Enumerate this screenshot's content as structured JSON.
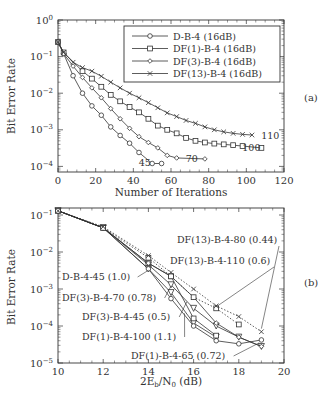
{
  "chart_data": [
    {
      "panel": "(a)",
      "type": "line",
      "title": "",
      "xlabel": "Number of Iterations",
      "ylabel": "Bit Error Rate",
      "xscale": "linear",
      "yscale": "log",
      "xlim": [
        0,
        120
      ],
      "ylim": [
        4e-05,
        1
      ],
      "xticks": [
        "0",
        "20",
        "40",
        "60",
        "80",
        "100",
        "120"
      ],
      "yticks": [
        "10^0",
        "10^-1",
        "10^-2",
        "10^-3",
        "10^-4"
      ],
      "legend_position": "upper right",
      "grid": false,
      "series": [
        {
          "name": "D-B-4 (16dB)",
          "marker": "circle",
          "x": [
            0,
            3,
            8,
            13,
            18,
            23,
            28,
            33,
            38,
            43,
            50,
            55
          ],
          "y": [
            0.25,
            0.12,
            0.03,
            0.01,
            0.0045,
            0.0025,
            0.0012,
            0.0007,
            0.00043,
            0.00024,
            0.00012,
            0.00012
          ],
          "end_label": "45"
        },
        {
          "name": "DF(1)-B-4 (16dB)",
          "marker": "square",
          "x": [
            0,
            3,
            13,
            18,
            23,
            28,
            33,
            38,
            43,
            48,
            53,
            58,
            63,
            68,
            73,
            78,
            83,
            88,
            93,
            98,
            108
          ],
          "y": [
            0.25,
            0.13,
            0.04,
            0.025,
            0.015,
            0.009,
            0.006,
            0.0042,
            0.003,
            0.002,
            0.0013,
            0.001,
            0.0008,
            0.0006,
            0.0005,
            0.00045,
            0.00042,
            0.0004,
            0.00038,
            0.00036,
            0.00032
          ],
          "end_label": "100"
        },
        {
          "name": "DF(3)-B-4 (16dB)",
          "marker": "diamond",
          "x": [
            0,
            3,
            8,
            13,
            18,
            23,
            28,
            33,
            38,
            43,
            48,
            53,
            58,
            63,
            78
          ],
          "y": [
            0.25,
            0.12,
            0.055,
            0.027,
            0.014,
            0.0075,
            0.0038,
            0.002,
            0.0011,
            0.00065,
            0.00045,
            0.00032,
            0.0002,
            0.00017,
            0.00016
          ],
          "end_label": "70"
        },
        {
          "name": "DF(13)-B-4 (16dB)",
          "marker": "x",
          "x": [
            0,
            3,
            8,
            13,
            18,
            23,
            28,
            33,
            38,
            43,
            48,
            53,
            58,
            63,
            68,
            73,
            78,
            83,
            88,
            93,
            98,
            103
          ],
          "y": [
            0.25,
            0.13,
            0.07,
            0.05,
            0.04,
            0.029,
            0.02,
            0.014,
            0.01,
            0.0075,
            0.0055,
            0.004,
            0.0029,
            0.0023,
            0.0018,
            0.0015,
            0.0012,
            0.001,
            0.00088,
            0.0008,
            0.00075,
            0.00072
          ],
          "end_label": "110"
        }
      ]
    },
    {
      "panel": "(b)",
      "type": "line",
      "title": "",
      "xlabel": "2E_b/N_0 (dB)",
      "ylabel": "Bit Error Rate",
      "xscale": "linear",
      "yscale": "log",
      "xlim": [
        10,
        20
      ],
      "ylim": [
        1e-05,
        0.15
      ],
      "xticks": [
        "10",
        "12",
        "14",
        "16",
        "18",
        "20"
      ],
      "yticks": [
        "10^-1",
        "10^-2",
        "10^-3",
        "10^-4",
        "10^-5"
      ],
      "grid": false,
      "series": [
        {
          "name": "D-B-4-45 (1.0)",
          "marker": "triangle-down",
          "style": "solid",
          "x": [
            10,
            12,
            14,
            15,
            16,
            17
          ],
          "y": [
            0.13,
            0.045,
            0.0035,
            0.0008,
            0.00012,
            5e-05
          ]
        },
        {
          "name": "DF(3)-B-4-70 (0.78)",
          "marker": "triangle-down",
          "style": "solid",
          "x": [
            10,
            12,
            14,
            15,
            16,
            17,
            18,
            19
          ],
          "y": [
            0.13,
            0.045,
            0.0045,
            0.0013,
            0.0003,
            0.0001,
            5e-05,
            2.8e-05
          ]
        },
        {
          "name": "DF(3)-B-4-45 (0.5)",
          "marker": "circle",
          "style": "solid",
          "x": [
            10,
            12,
            14,
            15,
            16,
            17,
            18,
            19
          ],
          "y": [
            0.13,
            0.045,
            0.0035,
            0.00055,
            0.0001,
            4e-05,
            3.3e-05,
            4.2e-05
          ]
        },
        {
          "name": "DF(1)-B-4-100 (1.1)",
          "marker": "square",
          "style": "solid",
          "x": [
            10,
            12,
            14,
            15,
            16,
            17
          ],
          "y": [
            0.13,
            0.045,
            0.005,
            0.0022,
            0.00016,
            5.5e-05
          ]
        },
        {
          "name": "DF(1)-B-4-65 (0.72)",
          "marker": "diamond",
          "style": "solid",
          "x": [
            10,
            12,
            14,
            15,
            16,
            17,
            18,
            19
          ],
          "y": [
            0.13,
            0.045,
            0.005,
            0.0022,
            0.0006,
            0.00012,
            5e-05,
            2.8e-05
          ]
        },
        {
          "name": "DF(13)-B-4-110 (0.6)",
          "marker": "square",
          "style": "dotted",
          "x": [
            10,
            12,
            14,
            15,
            16,
            17,
            18
          ],
          "y": [
            0.13,
            0.045,
            0.007,
            0.0022,
            0.0006,
            0.0003,
            0.00011
          ]
        },
        {
          "name": "DF(13)-B-4-80 (0.44)",
          "marker": "x",
          "style": "dotted",
          "x": [
            10,
            12,
            14,
            15,
            16,
            17,
            18,
            19
          ],
          "y": [
            0.13,
            0.048,
            0.008,
            0.0028,
            0.001,
            0.00035,
            0.00018,
            7e-05
          ]
        }
      ],
      "annotations": [
        "D-B-4-45 (1.0)",
        "DF(3)-B-4-70 (0.78)",
        "DF(3)-B-4-45 (0.5)",
        "DF(1)-B-4-100 (1.1)",
        "DF(1)-B-4-65 (0.72)",
        "DF(13)-B-4-110 (0.6)",
        "DF(13)-B-4-80 (0.44)"
      ]
    }
  ],
  "labels": {
    "panel_a": "(a)",
    "panel_b": "(b)",
    "a_xlabel": "Number of Iterations",
    "a_ylabel": "Bit Error Rate",
    "b_xlabel_pre": "2E",
    "b_xlabel_sub1": "b",
    "b_xlabel_mid": "/N",
    "b_xlabel_sub2": "0",
    "b_xlabel_post": " (dB)",
    "b_ylabel": "Bit Error Rate"
  }
}
